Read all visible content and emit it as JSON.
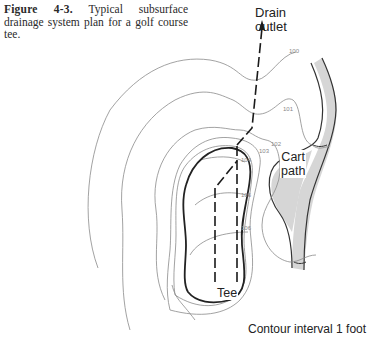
{
  "caption": {
    "figure_label": "Figure 4-3.",
    "text": "Typical subsurface drainage system plan for a golf course tee."
  },
  "labels": {
    "drain_outlet_line1": "Drain",
    "drain_outlet_line2": "outlet",
    "cart_path_line1": "Cart",
    "cart_path_line2": "path",
    "tee": "Tee",
    "contour_interval": "Contour interval 1 foot"
  },
  "contours": [
    {
      "label": "100",
      "x": 289,
      "y": 51
    },
    {
      "label": "101",
      "x": 283,
      "y": 97
    },
    {
      "label": "102",
      "x": 271,
      "y": 142
    },
    {
      "label": "103",
      "x": 259,
      "y": 149
    },
    {
      "label": "104",
      "x": 241,
      "y": 160
    },
    {
      "label": "105",
      "x": 241,
      "y": 194
    },
    {
      "label": "106",
      "x": 241,
      "y": 227
    }
  ],
  "colors": {
    "contour": "#8a8a8a",
    "tee_outline": "#222222",
    "drain": "#1a1a1a",
    "cart_path_fill": "#d6d6d6"
  }
}
